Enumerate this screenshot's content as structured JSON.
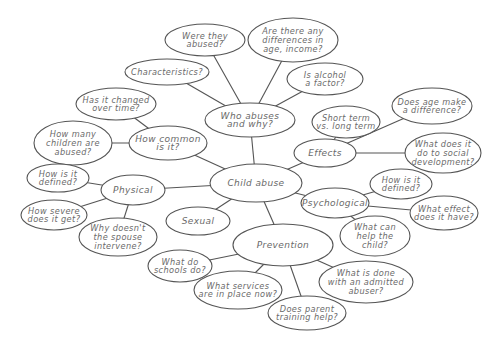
{
  "diagram": {
    "type": "mind-map",
    "colors": {
      "stroke": "#555555",
      "text": "#6a6a6a",
      "background": "#ffffff"
    },
    "center": {
      "id": "child-abuse",
      "lines": [
        "Child abuse"
      ],
      "cx": 256,
      "cy": 183,
      "rx": 46,
      "ry": 19
    },
    "nodes": [
      {
        "id": "who-abuses",
        "lines": [
          "Who abuses",
          "and why?"
        ],
        "cx": 250,
        "cy": 120,
        "rx": 45,
        "ry": 17,
        "hub": true
      },
      {
        "id": "were-they-abused",
        "lines": [
          "Were they",
          "abused?"
        ],
        "cx": 205,
        "cy": 40,
        "rx": 40,
        "ry": 16
      },
      {
        "id": "differences",
        "lines": [
          "Are there any",
          "differences in",
          "age, income?"
        ],
        "cx": 293,
        "cy": 40,
        "rx": 45,
        "ry": 22
      },
      {
        "id": "characteristics",
        "lines": [
          "Characteristics?"
        ],
        "cx": 167,
        "cy": 72,
        "rx": 42,
        "ry": 13
      },
      {
        "id": "alcohol",
        "lines": [
          "Is alcohol",
          "a factor?"
        ],
        "cx": 325,
        "cy": 79,
        "rx": 38,
        "ry": 16
      },
      {
        "id": "how-common",
        "lines": [
          "How common",
          "is it?"
        ],
        "cx": 168,
        "cy": 143,
        "rx": 39,
        "ry": 17,
        "hub": true
      },
      {
        "id": "changed-over-time",
        "lines": [
          "Has it changed",
          "over time?"
        ],
        "cx": 116,
        "cy": 104,
        "rx": 40,
        "ry": 16
      },
      {
        "id": "how-many-children",
        "lines": [
          "How many",
          "children are",
          "abused?"
        ],
        "cx": 73,
        "cy": 143,
        "rx": 39,
        "ry": 22
      },
      {
        "id": "effects",
        "lines": [
          "Effects"
        ],
        "cx": 325,
        "cy": 153,
        "rx": 31,
        "ry": 14,
        "hub": true
      },
      {
        "id": "short-long-term",
        "lines": [
          "Short term",
          "vs. long term"
        ],
        "cx": 346,
        "cy": 122,
        "rx": 34,
        "ry": 16
      },
      {
        "id": "age-difference",
        "lines": [
          "Does age make",
          "a difference?"
        ],
        "cx": 432,
        "cy": 106,
        "rx": 40,
        "ry": 18
      },
      {
        "id": "social-development",
        "lines": [
          "What does it",
          "do to social",
          "development?"
        ],
        "cx": 443,
        "cy": 153,
        "rx": 38,
        "ry": 20
      },
      {
        "id": "physical",
        "lines": [
          "Physical"
        ],
        "cx": 133,
        "cy": 190,
        "rx": 32,
        "ry": 15,
        "hub": true
      },
      {
        "id": "physical-defined",
        "lines": [
          "How is it",
          "defined?"
        ],
        "cx": 58,
        "cy": 178,
        "rx": 31,
        "ry": 14
      },
      {
        "id": "how-severe",
        "lines": [
          "How severe",
          "does it get?"
        ],
        "cx": 54,
        "cy": 215,
        "rx": 33,
        "ry": 15
      },
      {
        "id": "spouse-intervene",
        "lines": [
          "Why doesn't",
          "the spouse",
          "intervene?"
        ],
        "cx": 118,
        "cy": 237,
        "rx": 39,
        "ry": 19
      },
      {
        "id": "sexual",
        "lines": [
          "Sexual"
        ],
        "cx": 198,
        "cy": 221,
        "rx": 32,
        "ry": 14,
        "hub": true
      },
      {
        "id": "psychological",
        "lines": [
          "Psychological"
        ],
        "cx": 335,
        "cy": 203,
        "rx": 34,
        "ry": 15,
        "hub": true
      },
      {
        "id": "psych-defined",
        "lines": [
          "How is it",
          "defined?"
        ],
        "cx": 401,
        "cy": 184,
        "rx": 31,
        "ry": 15
      },
      {
        "id": "what-effect",
        "lines": [
          "What effect",
          "does it have?"
        ],
        "cx": 444,
        "cy": 213,
        "rx": 34,
        "ry": 17
      },
      {
        "id": "help-child",
        "lines": [
          "What can",
          "help the",
          "child?"
        ],
        "cx": 375,
        "cy": 236,
        "rx": 35,
        "ry": 20
      },
      {
        "id": "prevention",
        "lines": [
          "Prevention"
        ],
        "cx": 283,
        "cy": 245,
        "rx": 50,
        "ry": 21,
        "hub": true
      },
      {
        "id": "schools",
        "lines": [
          "What do",
          "schools do?"
        ],
        "cx": 180,
        "cy": 266,
        "rx": 32,
        "ry": 16
      },
      {
        "id": "services",
        "lines": [
          "What services",
          "are in place now?"
        ],
        "cx": 238,
        "cy": 290,
        "rx": 44,
        "ry": 19
      },
      {
        "id": "admitted-abuser",
        "lines": [
          "What is done",
          "with an admitted",
          "abuser?"
        ],
        "cx": 366,
        "cy": 282,
        "rx": 47,
        "ry": 21
      },
      {
        "id": "parent-training",
        "lines": [
          "Does parent",
          "training help?"
        ],
        "cx": 307,
        "cy": 313,
        "rx": 39,
        "ry": 17
      }
    ],
    "edges": [
      [
        "child-abuse",
        "who-abuses"
      ],
      [
        "child-abuse",
        "how-common"
      ],
      [
        "child-abuse",
        "effects"
      ],
      [
        "child-abuse",
        "physical"
      ],
      [
        "child-abuse",
        "sexual"
      ],
      [
        "child-abuse",
        "psychological"
      ],
      [
        "child-abuse",
        "prevention"
      ],
      [
        "who-abuses",
        "were-they-abused"
      ],
      [
        "who-abuses",
        "differences"
      ],
      [
        "who-abuses",
        "characteristics"
      ],
      [
        "who-abuses",
        "alcohol"
      ],
      [
        "how-common",
        "changed-over-time"
      ],
      [
        "how-common",
        "how-many-children"
      ],
      [
        "effects",
        "short-long-term"
      ],
      [
        "effects",
        "age-difference"
      ],
      [
        "effects",
        "social-development"
      ],
      [
        "physical",
        "physical-defined"
      ],
      [
        "physical",
        "how-severe"
      ],
      [
        "physical",
        "spouse-intervene"
      ],
      [
        "psychological",
        "psych-defined"
      ],
      [
        "psychological",
        "what-effect"
      ],
      [
        "psychological",
        "help-child"
      ],
      [
        "prevention",
        "schools"
      ],
      [
        "prevention",
        "services"
      ],
      [
        "prevention",
        "admitted-abuser"
      ],
      [
        "prevention",
        "parent-training"
      ]
    ]
  }
}
